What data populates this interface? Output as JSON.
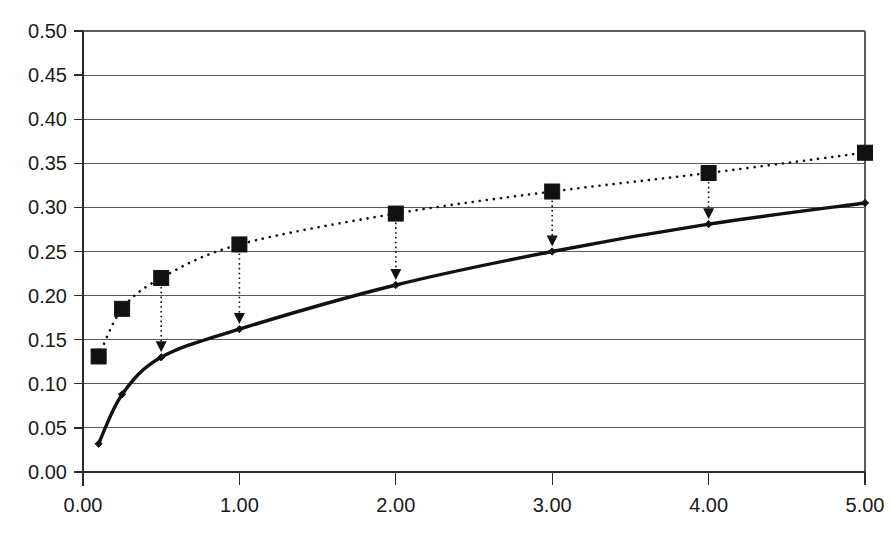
{
  "chart_data": {
    "type": "line",
    "title": "",
    "subtitle": "",
    "xlabel": "",
    "ylabel": "",
    "xlim": [
      0.0,
      5.0
    ],
    "ylim": [
      0.0,
      0.5
    ],
    "grid": true,
    "grid_axis": "y",
    "legend": false,
    "legend_position": "none",
    "x_ticks": [
      0.0,
      1.0,
      2.0,
      3.0,
      4.0,
      5.0
    ],
    "x_tick_labels": [
      "0.00",
      "1.00",
      "2.00",
      "3.00",
      "4.00",
      "5.00"
    ],
    "y_ticks": [
      0.0,
      0.05,
      0.1,
      0.15,
      0.2,
      0.25,
      0.3,
      0.35,
      0.4,
      0.45,
      0.5
    ],
    "y_tick_labels": [
      "0.00",
      "0.05",
      "0.10",
      "0.15",
      "0.20",
      "0.25",
      "0.30",
      "0.35",
      "0.40",
      "0.45",
      "0.50"
    ],
    "x": [
      0.1,
      0.25,
      0.5,
      1.0,
      2.0,
      3.0,
      4.0,
      5.0
    ],
    "series": [
      {
        "name": "upper-series",
        "style": "dotted",
        "marker": "square",
        "color": "#111111",
        "values": [
          0.131,
          0.185,
          0.22,
          0.258,
          0.293,
          0.318,
          0.339,
          0.362
        ]
      },
      {
        "name": "lower-series",
        "style": "solid",
        "marker": "diamond",
        "color": "#111111",
        "values": [
          0.032,
          0.088,
          0.13,
          0.162,
          0.212,
          0.25,
          0.281,
          0.305
        ]
      }
    ],
    "annotations": [
      {
        "type": "arrow",
        "direction": "down",
        "x": 0.5,
        "y_from": 0.22,
        "y_to": 0.13
      },
      {
        "type": "arrow",
        "direction": "down",
        "x": 1.0,
        "y_from": 0.258,
        "y_to": 0.162
      },
      {
        "type": "arrow",
        "direction": "down",
        "x": 2.0,
        "y_from": 0.293,
        "y_to": 0.212
      },
      {
        "type": "arrow",
        "direction": "down",
        "x": 3.0,
        "y_from": 0.318,
        "y_to": 0.25
      },
      {
        "type": "arrow",
        "direction": "down",
        "x": 4.0,
        "y_from": 0.339,
        "y_to": 0.281
      }
    ]
  }
}
